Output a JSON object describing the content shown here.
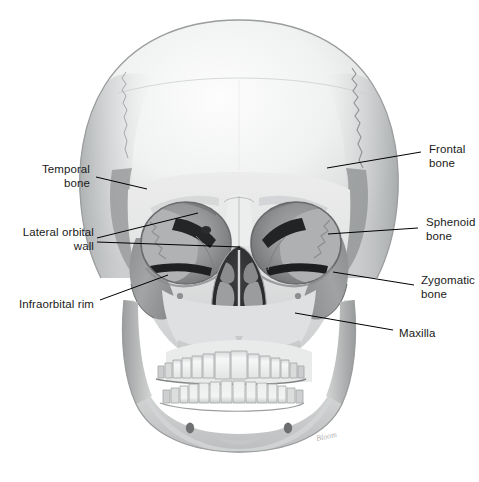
{
  "figure": {
    "background_color": "#ffffff",
    "label_color": "#1a1a1a",
    "leader_line_color": "#000000",
    "width": 479,
    "height": 482
  },
  "labels": [
    {
      "id": "temporal-bone",
      "text": "Temporal\nbone",
      "align": "right",
      "x": 16,
      "y": 162,
      "width": 74
    },
    {
      "id": "lateral-orbital-wall",
      "text": "Lateral orbital\nwall",
      "align": "right",
      "x": 8,
      "y": 225,
      "width": 86
    },
    {
      "id": "infraorbital-rim",
      "text": "Infraorbital rim",
      "align": "right",
      "x": 10,
      "y": 297,
      "width": 84
    },
    {
      "id": "frontal-bone",
      "text": "Frontal\nbone",
      "align": "left",
      "x": 429,
      "y": 142,
      "width": 50
    },
    {
      "id": "sphenoid-bone",
      "text": "Sphenoid\nbone",
      "align": "left",
      "x": 426,
      "y": 215,
      "width": 53
    },
    {
      "id": "zygomatic-bone",
      "text": "Zygomatic\nbone",
      "align": "left",
      "x": 421,
      "y": 273,
      "width": 58
    },
    {
      "id": "maxilla",
      "text": "Maxilla",
      "align": "left",
      "x": 399,
      "y": 326,
      "width": 48
    }
  ],
  "leader_lines": [
    {
      "id": "leader-temporal-bone",
      "points": "96,177 147,189"
    },
    {
      "id": "leader-lateral-orbital-wall-upper",
      "points": "97,238 198,213"
    },
    {
      "id": "leader-lateral-orbital-wall-lower",
      "points": "97,242 240,247"
    },
    {
      "id": "leader-infraorbital-rim",
      "points": "100,300 168,275"
    },
    {
      "id": "leader-frontal-bone",
      "points": "421,152 327,168"
    },
    {
      "id": "leader-sphenoid-bone",
      "points": "418,228 328,234"
    },
    {
      "id": "leader-zygomatic-bone",
      "points": "414,285 333,272"
    },
    {
      "id": "leader-maxilla",
      "points": "393,330 295,313"
    }
  ],
  "artwork": {
    "signature": "Bloom",
    "signature_x": 316,
    "signature_y": 432,
    "palette": {
      "cranium_light": "#e9eaea",
      "bone_midtone": "#c8cacb",
      "shaded_bone": "#9a9c9d",
      "orbit_shadow": "#7e8081",
      "deep_shadow": "#3a3c3d",
      "cavity_black": "#1c1e1f",
      "tooth_white": "#f4f5f5",
      "outline": "#6f7172"
    }
  }
}
